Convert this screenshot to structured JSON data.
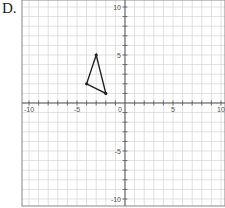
{
  "problem_label": "D.",
  "graph": {
    "x_range": [
      -10,
      10
    ],
    "y_range": [
      -10,
      10
    ],
    "x_tick_labels": [
      "-10",
      "-5",
      "0",
      "5",
      "10"
    ],
    "y_tick_labels": [
      "10",
      "5",
      "-5",
      "-10"
    ],
    "grid": true,
    "colors": {
      "grid": "#d4d4d4",
      "axis": "#555555",
      "shape": "#222222",
      "border": "#888888"
    }
  },
  "chart_data": {
    "type": "scatter",
    "title": "",
    "xlabel": "",
    "ylabel": "",
    "xlim": [
      -10,
      10
    ],
    "ylim": [
      -10,
      10
    ],
    "shape": "triangle",
    "vertices": [
      {
        "x": -3,
        "y": 5
      },
      {
        "x": -4,
        "y": 2
      },
      {
        "x": -2,
        "y": 1
      }
    ]
  }
}
